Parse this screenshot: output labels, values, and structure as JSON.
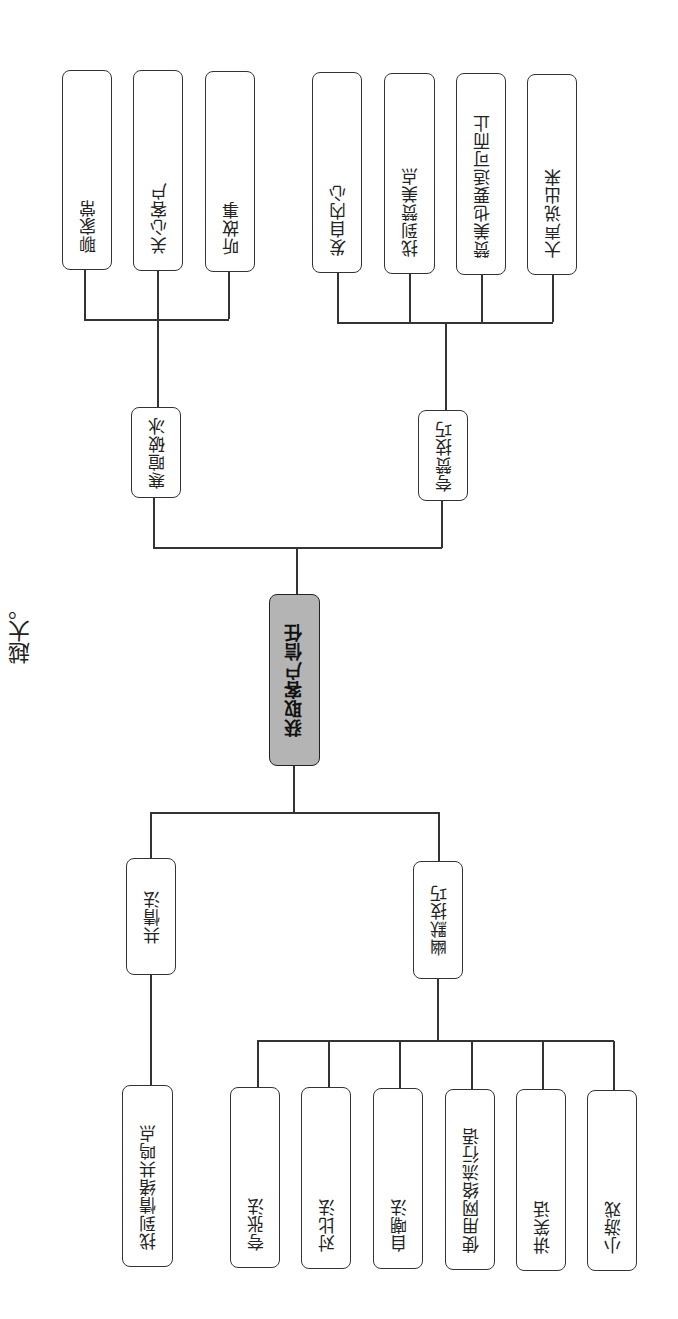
{
  "stray_text": "越大。",
  "root": {
    "label": "获取客户信任",
    "fill": "#b4b4b4"
  },
  "branches": {
    "icebreak": {
      "label": "寒暄破冰",
      "children": [
        "聊家常",
        "关心客户",
        "听故事"
      ]
    },
    "praise": {
      "label": "夸赞技巧",
      "children": [
        "发自内心",
        "找到赞美点",
        "赞美也要适可而止",
        "大声说出来"
      ]
    },
    "empathy": {
      "label": "共情法",
      "children": [
        "找到情绪共鸣点"
      ]
    },
    "humor": {
      "label": "幽默技巧",
      "children": [
        "夸张法",
        "对比法",
        "自嘲法",
        "使用网络流行语",
        "讲笑话",
        "小游戏"
      ]
    }
  }
}
